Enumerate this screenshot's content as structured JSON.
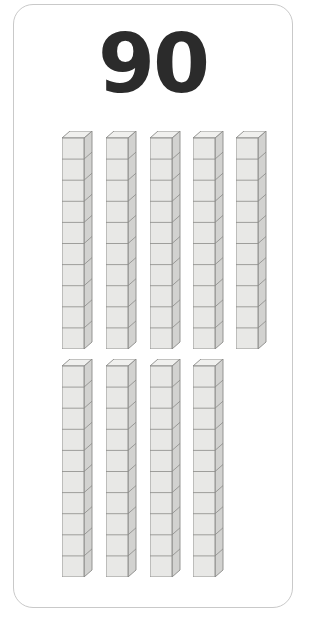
{
  "card": {
    "type": "base-ten-blocks-flashcard",
    "background_color": "#ffffff",
    "border_color": "#c9c9c9",
    "corner_radius_px": 20
  },
  "number": {
    "value": "90",
    "color": "#2b2b2b"
  },
  "manipulative": {
    "name": "base-ten-rods",
    "unit_value_per_rod": 10,
    "total_rods": 9,
    "total_value": 90,
    "cubes_per_rod": 10,
    "face_color": "#e8e8e6",
    "side_color": "#d2d2d0",
    "top_color": "#f0f0ee",
    "edge_color": "#8a8a88",
    "rows": [
      {
        "row_name": "top-row",
        "rod_count": 5,
        "rods": [
          {
            "label": "rod-1",
            "value": 10
          },
          {
            "label": "rod-2",
            "value": 10
          },
          {
            "label": "rod-3",
            "value": 10
          },
          {
            "label": "rod-4",
            "value": 10
          },
          {
            "label": "rod-5",
            "value": 10
          }
        ]
      },
      {
        "row_name": "bottom-row",
        "rod_count": 4,
        "rods": [
          {
            "label": "rod-6",
            "value": 10
          },
          {
            "label": "rod-7",
            "value": 10
          },
          {
            "label": "rod-8",
            "value": 10
          },
          {
            "label": "rod-9",
            "value": 10
          }
        ]
      }
    ]
  },
  "layout": {
    "row1_rod_x": [
      48,
      92,
      136,
      179,
      222
    ],
    "row2_rod_x": [
      48,
      92,
      136,
      179
    ]
  }
}
